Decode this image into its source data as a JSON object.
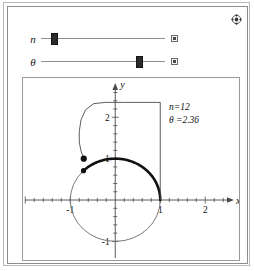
{
  "window": {
    "title": "Involute of a Circle",
    "settings_icon": "settings-plus-icon",
    "background": "#ffffff",
    "frame_color": "#8d8d8d"
  },
  "controls": [
    {
      "id": "n",
      "label": "n",
      "value": 12,
      "thumb_percent": 11,
      "animate_button": "play-button",
      "icon": "slider-thumb-icon"
    },
    {
      "id": "theta",
      "label": "θ",
      "value": 2.36,
      "thumb_percent": 80,
      "animate_button": "play-button",
      "icon": "slider-thumb-icon"
    }
  ],
  "annotations": {
    "n_text": "n=12",
    "theta_text": "θ =2.36"
  },
  "chart_data": {
    "type": "line",
    "title": "",
    "xlabel": "x",
    "ylabel": "y",
    "xlim": [
      -2.05,
      2.75
    ],
    "ylim": [
      -1.45,
      2.95
    ],
    "grid": false,
    "legend": null,
    "x_ticks": [
      -2,
      -1.8,
      -1.6,
      -1.4,
      -1.2,
      -1,
      -0.8,
      -0.6,
      -0.4,
      -0.2,
      0.2,
      0.4,
      0.6,
      0.8,
      1,
      1.2,
      1.4,
      1.6,
      1.8,
      2,
      2.2,
      2.4
    ],
    "x_tick_labels": [
      {
        "value": -1,
        "label": "-1"
      },
      {
        "value": 1,
        "label": "1"
      },
      {
        "value": 2,
        "label": "2"
      }
    ],
    "y_ticks": [
      -1,
      -0.8,
      -0.6,
      -0.4,
      -0.2,
      0.2,
      0.4,
      0.6,
      0.8,
      1,
      1.2,
      1.4,
      1.6,
      1.8,
      2,
      2.2,
      2.4,
      2.6
    ],
    "y_tick_labels": [
      {
        "value": 2,
        "label": "2"
      },
      {
        "value": 1,
        "label": "1"
      },
      {
        "value": -1,
        "label": "-1"
      }
    ],
    "series": [
      {
        "name": "unit-circle",
        "kind": "circle",
        "center": [
          0,
          0
        ],
        "radius": 1,
        "stroke": "#6b6b6b",
        "width": 0.9
      },
      {
        "name": "wrapped-arc",
        "kind": "arc",
        "center": [
          0,
          0
        ],
        "radius": 1,
        "theta_start": 0,
        "theta_end": 2.36,
        "stroke": "#111111",
        "width": 2.6
      },
      {
        "name": "unwound-string",
        "kind": "polyline-with-curve",
        "description": "Tangent string of length theta unwound from the circle, drawn as n=12 straight segments",
        "points": [
          [
            1.0,
            0.0
          ],
          [
            1.0,
            0.45
          ],
          [
            1.0,
            0.95
          ],
          [
            1.0,
            1.45
          ],
          [
            1.0,
            1.95
          ],
          [
            1.0,
            2.36
          ],
          [
            0.62,
            2.36
          ],
          [
            0.18,
            2.36
          ],
          [
            -0.22,
            2.36
          ],
          [
            -0.48,
            2.33
          ],
          [
            -0.66,
            2.18
          ],
          [
            -0.76,
            1.94
          ],
          [
            -0.8,
            1.66
          ],
          [
            -0.8,
            1.4
          ],
          [
            -0.76,
            1.18
          ],
          [
            -0.7,
            1.0
          ]
        ],
        "stroke": "#4a4a4a",
        "width": 0.9
      },
      {
        "name": "string-endpoint",
        "kind": "point",
        "point": [
          -0.7,
          1.0
        ],
        "fill": "#111111",
        "size": 3.1
      },
      {
        "name": "tangent-point",
        "kind": "point",
        "point": [
          -0.705,
          0.709
        ],
        "fill": "#111111",
        "size": 2.6
      }
    ]
  }
}
